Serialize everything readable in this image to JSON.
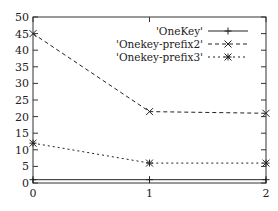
{
  "chart_data": {
    "type": "line",
    "title": "",
    "xlabel": "",
    "ylabel": "",
    "x": [
      0,
      1,
      2
    ],
    "xlim": [
      0,
      2
    ],
    "ylim": [
      0,
      50
    ],
    "x_ticks": [
      "0",
      "1",
      "2"
    ],
    "y_ticks": [
      "0",
      "5",
      "10",
      "15",
      "20",
      "25",
      "30",
      "35",
      "40",
      "45",
      "50"
    ],
    "grid": false,
    "legend_position": "top-right",
    "series": [
      {
        "name": "'OneKey'",
        "values": [
          1,
          1,
          1
        ],
        "line_style": "solid",
        "marker": "+",
        "color": "#222222"
      },
      {
        "name": "'Onekey-prefix2'",
        "values": [
          45,
          21.5,
          21
        ],
        "line_style": "dashed",
        "marker": "x",
        "color": "#222222"
      },
      {
        "name": "'Onekey-prefix3'",
        "values": [
          12,
          6,
          6
        ],
        "line_style": "dotted",
        "marker": "*",
        "color": "#222222"
      }
    ]
  }
}
